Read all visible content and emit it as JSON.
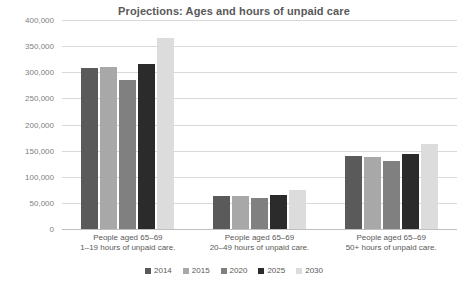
{
  "chart_data": {
    "type": "bar",
    "title": "Projections: Ages and hours of unpaid care",
    "xlabel": "",
    "ylabel": "",
    "ylim": [
      0,
      400000
    ],
    "ytick_step": 50000,
    "ytick_labels": [
      "400,000",
      "350,000",
      "300,000",
      "250,000",
      "200,000",
      "150,000",
      "100,000",
      "50,000",
      "0"
    ],
    "ytick_values": [
      400000,
      350000,
      300000,
      250000,
      200000,
      150000,
      100000,
      50000,
      0
    ],
    "grid": true,
    "legend_position": "bottom",
    "categories": [
      "People aged 65–69 1–19 hours of unpaid care.",
      "People aged 65–69 20–49 hours of unpaid care.",
      "People aged 65–69 50+ hours of unpaid care."
    ],
    "category_lines": [
      {
        "line1": "People aged 65–69",
        "line2": "1–19 hours of unpaid care."
      },
      {
        "line1": "People aged 65–69",
        "line2": "20–49 hours of unpaid care."
      },
      {
        "line1": "People aged 65–69",
        "line2": "50+ hours of unpaid care."
      }
    ],
    "series": [
      {
        "name": "2014",
        "color": "#5a5a5a",
        "values": [
          308000,
          64000,
          140000
        ]
      },
      {
        "name": "2015",
        "color": "#a8a8a8",
        "values": [
          311000,
          64000,
          137000
        ]
      },
      {
        "name": "2020",
        "color": "#808080",
        "values": [
          286000,
          59000,
          130000
        ]
      },
      {
        "name": "2025",
        "color": "#2b2b2b",
        "values": [
          315000,
          65000,
          144000
        ]
      },
      {
        "name": "2030",
        "color": "#dcdcdc",
        "values": [
          365000,
          75000,
          162000
        ]
      }
    ]
  }
}
